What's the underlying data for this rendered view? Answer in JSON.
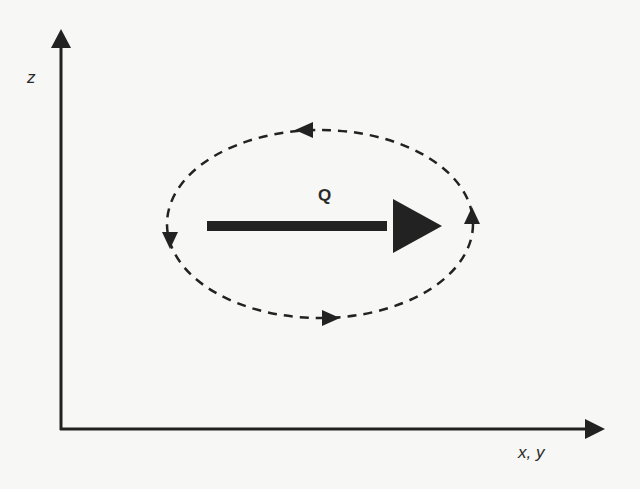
{
  "diagram": {
    "axes": {
      "vertical_label": "z",
      "horizontal_label": "x, y"
    },
    "flow": {
      "label": "Q",
      "direction": "right"
    },
    "circulation": {
      "style": "dashed",
      "direction": "clockwise"
    },
    "colors": {
      "ink": "#222222",
      "background": "#f7f7f5"
    }
  }
}
